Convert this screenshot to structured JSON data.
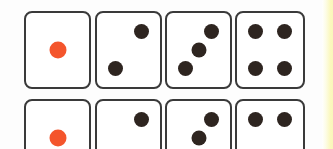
{
  "scene": {
    "title": "Dice faces chart",
    "background_color": "#fdfdfd",
    "edge_strip_color": "#fbf8be",
    "die_border_color": "#3a3a3a",
    "die_face_color": "#ffffff",
    "pip_color": "#2e2520",
    "highlight_pip_color": "#f4552c"
  },
  "rows": [
    {
      "name": "top-row",
      "dice": [
        {
          "value": "1",
          "pips": [
            "center"
          ],
          "highlight": "true",
          "label": "die-face-one"
        },
        {
          "value": "2",
          "pips": [
            "top-right",
            "bottom-left"
          ],
          "highlight": "false",
          "label": "die-face-two"
        },
        {
          "value": "3",
          "pips": [
            "top-right",
            "center",
            "bottom-left"
          ],
          "highlight": "false",
          "label": "die-face-three"
        },
        {
          "value": "4",
          "pips": [
            "top-left",
            "top-right",
            "bottom-left",
            "bottom-right"
          ],
          "highlight": "false",
          "label": "die-face-four"
        }
      ]
    },
    {
      "name": "bottom-row",
      "dice": [
        {
          "value": "1",
          "pips": [
            "center"
          ],
          "highlight": "true",
          "label": "die-face-one"
        },
        {
          "value": "2",
          "pips": [
            "top-right",
            "bottom-left"
          ],
          "highlight": "false",
          "label": "die-face-two"
        },
        {
          "value": "3",
          "pips": [
            "top-right",
            "center",
            "bottom-left"
          ],
          "highlight": "false",
          "label": "die-face-three"
        },
        {
          "value": "4",
          "pips": [
            "top-left",
            "top-right",
            "bottom-left",
            "bottom-right"
          ],
          "highlight": "false",
          "label": "die-face-four"
        }
      ]
    }
  ]
}
